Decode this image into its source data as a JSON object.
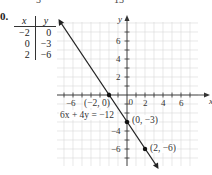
{
  "problem": {
    "number_label": "0.",
    "top_fragments": [
      "3",
      "13"
    ]
  },
  "table": {
    "headers": [
      "x",
      "y"
    ],
    "rows": [
      [
        "−2",
        "0"
      ],
      [
        "0",
        "−3"
      ],
      [
        "2",
        "−6"
      ]
    ]
  },
  "graph": {
    "x_axis_label": "x",
    "y_axis_label": "y",
    "equation_label": "6x + 4y = −12",
    "points": [
      {
        "label": "(−2, 0)",
        "x": -2,
        "y": 0
      },
      {
        "label": "(0, −3)",
        "x": 0,
        "y": -3
      },
      {
        "label": "(2, −6)",
        "x": 2,
        "y": -6
      }
    ],
    "x_tick_labels": [
      "−6",
      "2",
      "4",
      "6"
    ],
    "y_tick_labels": [
      "6",
      "4",
      "2",
      "−4",
      "−6"
    ],
    "origin_label": "0",
    "line_color": "#222222",
    "grid_color": "#d9d9d9"
  },
  "chart_data": {
    "type": "line",
    "title": "",
    "xlabel": "x",
    "ylabel": "y",
    "xlim": [
      -7.8,
      7.8
    ],
    "ylim": [
      -7.8,
      8
    ],
    "grid": true,
    "x_ticks": [
      -6,
      -4,
      -2,
      0,
      2,
      4,
      6
    ],
    "y_ticks": [
      -6,
      -4,
      -2,
      0,
      2,
      4,
      6
    ],
    "series": [
      {
        "name": "6x + 4y = −12",
        "x": [
          -2,
          0,
          2
        ],
        "y": [
          0,
          -3,
          -6
        ]
      }
    ],
    "annotations": [
      "(−2, 0)",
      "(0, −3)",
      "(2, −6)",
      "6x + 4y = −12"
    ],
    "table": {
      "x": [
        -2,
        0,
        2
      ],
      "y": [
        0,
        -3,
        -6
      ]
    }
  }
}
